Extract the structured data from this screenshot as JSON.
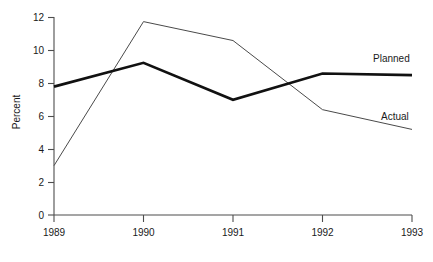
{
  "chart_data": {
    "type": "line",
    "title": "",
    "xlabel": "",
    "ylabel": "Percent",
    "categories": [
      "1989",
      "1990",
      "1991",
      "1992",
      "1993"
    ],
    "x": [
      1989,
      1990,
      1991,
      1992,
      1993
    ],
    "series": [
      {
        "name": "Planned",
        "values": [
          7.8,
          9.25,
          7.0,
          8.6,
          8.5
        ],
        "style": "thick",
        "color": "#111111"
      },
      {
        "name": "Actual",
        "values": [
          3.0,
          11.75,
          10.6,
          6.4,
          5.2
        ],
        "style": "thin",
        "color": "#4a4a4a"
      }
    ],
    "ylim": [
      0,
      12
    ],
    "yticks": [
      0,
      2,
      4,
      6,
      8,
      10,
      12
    ],
    "ytick_labels": [
      "0",
      "2",
      "4",
      "6",
      "8",
      "10",
      "12"
    ],
    "xtick_labels": [
      "1989",
      "1990",
      "1991",
      "1992",
      "1993"
    ],
    "grid": false,
    "legend": "inline-right-labels",
    "annotations": [
      {
        "text": "Planned",
        "series": "Planned"
      },
      {
        "text": "Actual",
        "series": "Actual"
      }
    ]
  },
  "axes": {
    "y_title": "Percent",
    "y_ticks": [
      {
        "label": "12",
        "value": 12
      },
      {
        "label": "10",
        "value": 10
      },
      {
        "label": "8",
        "value": 8
      },
      {
        "label": "6",
        "value": 6
      },
      {
        "label": "4",
        "value": 4
      },
      {
        "label": "2",
        "value": 2
      },
      {
        "label": "0",
        "value": 0
      }
    ],
    "x_ticks": [
      {
        "label": "1989",
        "value": 1989
      },
      {
        "label": "1990",
        "value": 1990
      },
      {
        "label": "1991",
        "value": 1991
      },
      {
        "label": "1992",
        "value": 1992
      },
      {
        "label": "1993",
        "value": 1993
      }
    ]
  },
  "labels": {
    "planned": "Planned",
    "actual": "Actual"
  }
}
